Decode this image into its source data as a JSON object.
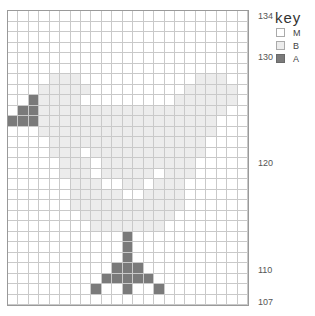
{
  "chart_data": {
    "type": "heatmap",
    "title": "",
    "columns": 23,
    "rows": 28,
    "row_number_labels": [
      {
        "row": 0,
        "label": "134"
      },
      {
        "row": 4,
        "label": "130"
      },
      {
        "row": 14,
        "label": "120"
      },
      {
        "row": 24,
        "label": "110"
      },
      {
        "row": 27,
        "label": "107"
      }
    ],
    "legend": {
      "title": "key",
      "items": [
        {
          "code": "M",
          "label": "M",
          "color": "#ffffff"
        },
        {
          "code": "B",
          "label": "B",
          "color": "#ececec"
        },
        {
          "code": "A",
          "label": "A",
          "color": "#7a7a7a"
        }
      ]
    },
    "grid": [
      "MMMMMMMMMMMMMMMMMMMMMMM",
      "MMMMMMMMMMMMMMMMMMMMMMM",
      "MMMMMMMMMMMMMMMMMMMMMMM",
      "MMMMMMMMMMMMMMMMMMMMMMM",
      "MMMMMMMMMMMMMMMMMMMMMMM",
      "MMMMMMMMMMMMMMMMMMMMMMM",
      "MMMMBBBMMMMMMMMMMMBBBMM",
      "MMMBBBBBMMMMMMMMMBBBBBM",
      "MMABBBBMMMMMMMMMBBBBBBM",
      "MAABBBBBBBBBBBBBBBBBBMM",
      "AAABBBBBBBBBBBBBBBBBMMM",
      "MMMBBBBBBBBBBBBBBBBBMMM",
      "MMMMBBBBBBBBBBBBBBBMMMM",
      "MMMMBBBMBBBBBBBBBBBMMMM",
      "MMMMMBBBMBBBBBBBBBMMMMM",
      "MMMMMBBBMBBBBBMBBBMMMMM",
      "MMMMMMBBBMMBBMBBBMMMMMM",
      "MMMMMMBBBBBMMBBBBMMMMMM",
      "MMMMMMBBBBBBBBBBBMMMMMM",
      "MMMMMMMBBBBBBBBBMMMMMMM",
      "MMMMMMMMBBBBBBBMMMMMMMM",
      "MMMMMMMMMMMAMMMMMMMMMMM",
      "MMMMMMMMMMMAMMMMMMMMMMM",
      "MMMMMMMMMMMAMMMMMMMMMMM",
      "MMMMMMMMMMAAAMMMMMMMMMM",
      "MMMMMMMMMAAAAAMMMMMMMMM",
      "MMMMMMMMAMMAMMAMMMMMMMM",
      "MMMMMMMMMMMMMMMMMMMMMMM"
    ]
  },
  "labels": {
    "r134": "134",
    "r130": "130",
    "r120": "120",
    "r110": "110",
    "r107": "107"
  },
  "legend": {
    "title": "key",
    "items": [
      {
        "label": "M"
      },
      {
        "label": "B"
      },
      {
        "label": "A"
      }
    ]
  }
}
